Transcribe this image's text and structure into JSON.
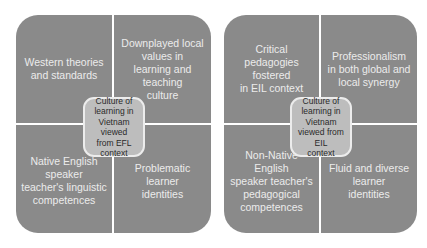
{
  "diagrams": [
    {
      "center": "Culture of\nlearning in\nVietnam viewed\nfrom EFL\ncontext",
      "quadrants": {
        "top_left": "Western theories\nand standards",
        "top_right": "Downplayed local\nvalues in\nlearning and teaching\nculture",
        "bottom_left": "Native English speaker\nteacher's linguistic\ncompetences",
        "bottom_right": "Problematic\nlearner\nidentities"
      }
    },
    {
      "center": "Culture of\nlearning in\nVietnam\nviewed from EIL\ncontext",
      "quadrants": {
        "top_left": "Critical pedagogies\nfostered\nin EIL context",
        "top_right": "Professionalism\nin  both global and\nlocal synergy",
        "bottom_left": "Non-Native English\nspeaker teacher's\npedagogical\ncompetences",
        "bottom_right": "Fluid and diverse\nlearner\nidentities"
      }
    }
  ],
  "colors": {
    "quadrant": "#8a8a8a",
    "center": "#bdbdbd",
    "divider": "#ececec"
  }
}
